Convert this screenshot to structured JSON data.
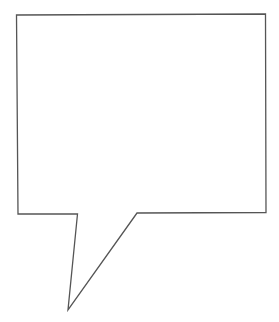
{
  "diagram": {
    "type": "speech-bubble",
    "canvas": {
      "width": 279,
      "height": 322,
      "background": "#ffffff"
    },
    "bubble": {
      "stroke": "#555555",
      "stroke_width": 1.3,
      "fill": "#ffffff",
      "points": [
        [
          16.5,
          15
        ],
        [
          265.5,
          14
        ],
        [
          266,
          212.5
        ],
        [
          137,
          213
        ],
        [
          68,
          310
        ],
        [
          77.5,
          214
        ],
        [
          18,
          214
        ]
      ],
      "text": ""
    }
  }
}
